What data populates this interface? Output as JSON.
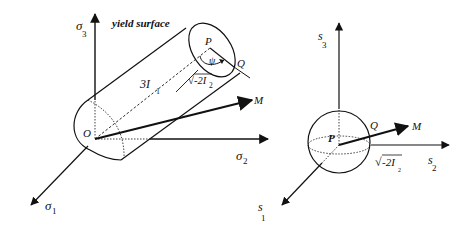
{
  "figure": {
    "left_panel": {
      "title_label": "yield surface",
      "axes": {
        "sigma3": {
          "symbol": "σ",
          "subscript": "3"
        },
        "sigma2": {
          "symbol": "σ",
          "subscript": "2"
        },
        "sigma1": {
          "symbol": "σ",
          "subscript": "1"
        }
      },
      "points": {
        "origin": "O",
        "center": "P",
        "surface_point": "Q",
        "vector_tip": "M"
      },
      "length_labels": {
        "axis_length": {
          "prefix": "3I",
          "subscript": "1"
        },
        "radius": {
          "radical": "√",
          "body": "-2I",
          "subscript": "2"
        }
      },
      "angle_label": "ψ"
    },
    "right_panel": {
      "axes": {
        "s3": {
          "symbol": "s",
          "subscript": "3"
        },
        "s2": {
          "symbol": "s",
          "subscript": "2"
        },
        "s1": {
          "symbol": "s",
          "subscript": "1"
        }
      },
      "points": {
        "center": "P",
        "surface_point": "Q",
        "vector_tip": "M"
      },
      "length_labels": {
        "radius": {
          "radical": "√",
          "body": "-2I",
          "subscript": "2"
        }
      }
    }
  }
}
